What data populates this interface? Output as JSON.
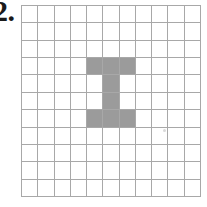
{
  "figure": {
    "problem_number": "2."
  },
  "grid": {
    "rows": 11,
    "columns": 11,
    "line_color": "#a8a8a8",
    "cell_background": "#ffffff",
    "shaded_color": "#9b9b9b",
    "shaded_cells": [
      [
        3,
        4
      ],
      [
        3,
        5
      ],
      [
        3,
        6
      ],
      [
        4,
        5
      ],
      [
        5,
        5
      ],
      [
        6,
        4
      ],
      [
        6,
        5
      ],
      [
        6,
        6
      ]
    ],
    "shaded_count": 8,
    "total_cells": 121
  },
  "artifacts": {
    "speck_color": "#d9d9d9"
  }
}
